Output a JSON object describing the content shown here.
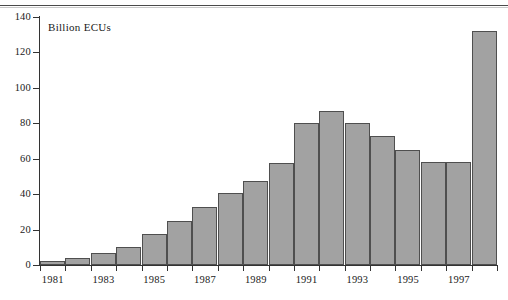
{
  "chart_data": {
    "type": "bar",
    "title": "",
    "subtitle": "",
    "axis_note": "Billion ECUs",
    "xlabel": "",
    "ylabel": "Billion ECUs",
    "ylim": [
      0,
      140
    ],
    "y_ticks": [
      0,
      20,
      40,
      60,
      80,
      100,
      120,
      140
    ],
    "y_tick_labels": [
      "0",
      "20",
      "40",
      "60",
      "80",
      "100",
      "120",
      "140"
    ],
    "grid": false,
    "legend": null,
    "categories": [
      "1981",
      "1982",
      "1983",
      "1984",
      "1985",
      "1986",
      "1987",
      "1988",
      "1989",
      "1990",
      "1991",
      "1992",
      "1993",
      "1994",
      "1995",
      "1996",
      "1997",
      "1998"
    ],
    "x_tick_labels": [
      "1981",
      "",
      "1983",
      "",
      "1985",
      "",
      "1987",
      "",
      "1989",
      "",
      "1991",
      "",
      "1993",
      "",
      "1995",
      "",
      "1997",
      ""
    ],
    "values": [
      2.5,
      4,
      7,
      10,
      17.5,
      25,
      33,
      40.5,
      47.5,
      57.5,
      80,
      87,
      80,
      73,
      65,
      58,
      58,
      132
    ],
    "bar_color": "#a2a2a2",
    "bar_edge_color": "#4f4f4f",
    "axis_color": "#333333",
    "background": "#ffffff"
  }
}
